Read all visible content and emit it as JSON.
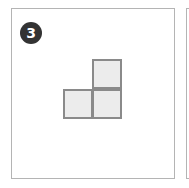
{
  "figure": {
    "badge_number": "3",
    "colors": {
      "badge_bg": "#333333",
      "badge_text": "#ffffff",
      "panel_border": "#b4b4b4",
      "cell_fill": "#ececec",
      "cell_border": "#8a8a8a"
    },
    "shape": {
      "description": "L-shaped arrangement of three unit squares",
      "cells": [
        {
          "row": 0,
          "col": 1
        },
        {
          "row": 1,
          "col": 0
        },
        {
          "row": 1,
          "col": 1
        }
      ]
    }
  }
}
